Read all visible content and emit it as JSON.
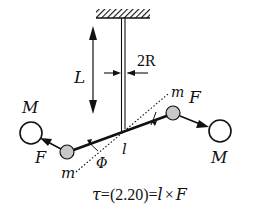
{
  "diagram": {
    "labels": {
      "length": "L",
      "fiber_width": "2R",
      "left_large_mass": "M",
      "right_large_mass": "M",
      "left_small_mass": "m",
      "right_small_mass": "m",
      "left_force": "F",
      "right_force": "F",
      "angle": "Φ",
      "lever_arm": "l"
    },
    "equation": {
      "lhs": "τ",
      "eq1": "=",
      "ref": "(2.20)",
      "eq2": "=",
      "rhs_l": "l",
      "times": "×",
      "rhs_F": "F"
    },
    "colors": {
      "ink": "#111111",
      "small_mass_fill": "#c8c8c8",
      "large_mass_fill": "#ffffff",
      "background": "#ffffff"
    }
  }
}
